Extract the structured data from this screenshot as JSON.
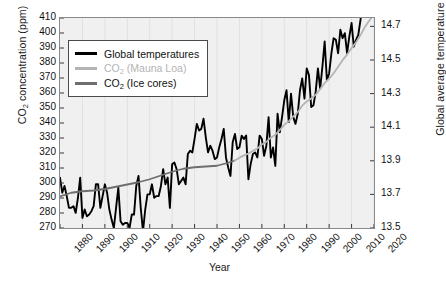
{
  "chart_data": {
    "type": "line",
    "title": "",
    "xlabel": "Year",
    "ylabel_left": "CO2 concentration (ppm)",
    "ylabel_right": "Global average temperature (°C)",
    "xlim": [
      1880,
      2020
    ],
    "xticks": [
      1880,
      1890,
      1900,
      1910,
      1920,
      1930,
      1940,
      1950,
      1960,
      1970,
      1980,
      1990,
      2000,
      2010,
      2020
    ],
    "ylim_left": [
      270,
      410
    ],
    "yticks_left": [
      270,
      280,
      290,
      300,
      310,
      320,
      330,
      340,
      350,
      360,
      370,
      380,
      390,
      400,
      410
    ],
    "ylim_right": [
      13.5,
      14.75
    ],
    "yticks_right": [
      13.5,
      13.7,
      13.9,
      14.1,
      14.3,
      14.5,
      14.7
    ],
    "grid": "vertical",
    "legend_position": "top-left",
    "series": [
      {
        "name": "Global temperatures",
        "color": "#000000",
        "axis": "right",
        "unit": "°C",
        "x": [
          1880,
          1881,
          1882,
          1883,
          1884,
          1885,
          1886,
          1887,
          1888,
          1889,
          1890,
          1891,
          1892,
          1893,
          1894,
          1895,
          1896,
          1897,
          1898,
          1899,
          1900,
          1901,
          1902,
          1903,
          1904,
          1905,
          1906,
          1907,
          1908,
          1909,
          1910,
          1911,
          1912,
          1913,
          1914,
          1915,
          1916,
          1917,
          1918,
          1919,
          1920,
          1921,
          1922,
          1923,
          1924,
          1925,
          1926,
          1927,
          1928,
          1929,
          1930,
          1931,
          1932,
          1933,
          1934,
          1935,
          1936,
          1937,
          1938,
          1939,
          1940,
          1941,
          1942,
          1943,
          1944,
          1945,
          1946,
          1947,
          1948,
          1949,
          1950,
          1951,
          1952,
          1953,
          1954,
          1955,
          1956,
          1957,
          1958,
          1959,
          1960,
          1961,
          1962,
          1963,
          1964,
          1965,
          1966,
          1967,
          1968,
          1969,
          1970,
          1971,
          1972,
          1973,
          1974,
          1975,
          1976,
          1977,
          1978,
          1979,
          1980,
          1981,
          1982,
          1983,
          1984,
          1985,
          1986,
          1987,
          1988,
          1989,
          1990,
          1991,
          1992,
          1993,
          1994,
          1995,
          1996,
          1997,
          1998,
          1999,
          2000,
          2001,
          2002,
          2003,
          2004,
          2005,
          2006,
          2007,
          2008,
          2009,
          2010,
          2011,
          2012,
          2013,
          2014,
          2015,
          2016,
          2017,
          2018,
          2019,
          2020
        ],
        "values": [
          13.8,
          13.71,
          13.75,
          13.69,
          13.62,
          13.62,
          13.63,
          13.59,
          13.68,
          13.8,
          13.56,
          13.61,
          13.57,
          13.58,
          13.6,
          13.63,
          13.76,
          13.76,
          13.62,
          13.69,
          13.76,
          13.71,
          13.61,
          13.55,
          13.5,
          13.62,
          13.74,
          13.54,
          13.52,
          13.53,
          13.53,
          13.5,
          13.58,
          13.58,
          13.75,
          13.81,
          13.62,
          13.48,
          13.61,
          13.7,
          13.7,
          13.76,
          13.68,
          13.69,
          13.69,
          13.75,
          13.85,
          13.76,
          13.8,
          13.62,
          13.88,
          13.89,
          13.85,
          13.76,
          13.78,
          13.8,
          13.76,
          13.94,
          13.96,
          13.95,
          14.03,
          14.12,
          14.08,
          14.09,
          14.15,
          14.04,
          13.95,
          13.99,
          13.96,
          13.91,
          13.92,
          13.98,
          14.03,
          14.09,
          13.92,
          13.86,
          13.81,
          14.01,
          14.06,
          13.97,
          13.98,
          14.05,
          14.03,
          14.05,
          13.79,
          13.88,
          13.94,
          13.95,
          13.92,
          14.05,
          14.03,
          13.93,
          13.99,
          14.16,
          13.92,
          13.98,
          13.87,
          14.18,
          14.07,
          14.16,
          14.26,
          14.32,
          14.13,
          14.3,
          14.16,
          14.12,
          14.18,
          14.32,
          14.39,
          14.27,
          14.45,
          14.41,
          14.22,
          14.23,
          14.31,
          14.45,
          14.33,
          14.46,
          14.61,
          14.38,
          14.42,
          14.54,
          14.63,
          14.62,
          14.54,
          14.68,
          14.63,
          14.66,
          14.54,
          14.64,
          14.72,
          14.58,
          14.62,
          14.65,
          14.74,
          14.9,
          14.99,
          14.92,
          14.83,
          14.95,
          14.98
        ]
      },
      {
        "name": "CO2 (Ice cores)",
        "color": "#6e6e6e",
        "axis": "left",
        "unit": "ppm",
        "x": [
          1880,
          1885,
          1890,
          1895,
          1900,
          1905,
          1910,
          1915,
          1920,
          1925,
          1930,
          1935,
          1940,
          1945,
          1950,
          1955,
          1958
        ],
        "values": [
          291.0,
          293.5,
          294.5,
          295.0,
          296.0,
          297.5,
          299.0,
          300.5,
          302.5,
          305.0,
          307.5,
          309.5,
          310.5,
          311.0,
          311.5,
          313.5,
          315.0
        ]
      },
      {
        "name": "CO2 (Mauna Loa)",
        "color": "#b4b4b4",
        "axis": "left",
        "unit": "ppm",
        "x": [
          1958,
          1960,
          1962,
          1964,
          1966,
          1968,
          1970,
          1972,
          1974,
          1976,
          1978,
          1980,
          1982,
          1984,
          1986,
          1988,
          1990,
          1992,
          1994,
          1996,
          1998,
          2000,
          2002,
          2004,
          2006,
          2008,
          2010,
          2012,
          2014,
          2016,
          2018,
          2020
        ],
        "values": [
          315.0,
          316.9,
          318.4,
          319.6,
          321.4,
          323.0,
          325.7,
          327.4,
          330.2,
          332.1,
          335.4,
          338.8,
          341.1,
          344.4,
          347.2,
          351.6,
          354.4,
          356.4,
          358.8,
          362.6,
          366.7,
          369.5,
          373.2,
          377.5,
          381.9,
          385.6,
          389.9,
          393.8,
          398.6,
          404.2,
          408.5,
          412.5
        ]
      }
    ]
  },
  "legend": {
    "items": [
      {
        "label": "Global temperatures",
        "color": "#000000",
        "muted": false,
        "has_sub": false
      },
      {
        "label": "CO2 (Mauna Loa)",
        "color": "#b4b4b4",
        "muted": true,
        "has_sub": true
      },
      {
        "label": "CO2 (Ice cores)",
        "color": "#6e6e6e",
        "muted": false,
        "has_sub": true
      }
    ]
  },
  "axis_titles": {
    "left_prefix": "CO",
    "left_sub": "2",
    "left_suffix": " concentration (ppm)",
    "right_prefix": "Global average temperature (",
    "right_sup": "o",
    "right_suffix": "C)",
    "bottom": "Year"
  }
}
